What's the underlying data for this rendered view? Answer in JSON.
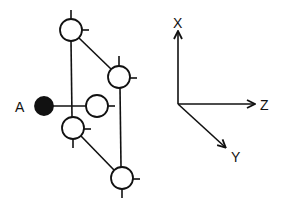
{
  "diagram": {
    "type": "molecular-geometry",
    "colors": {
      "stroke": "#111111",
      "fill_open": "#ffffff",
      "fill_solid": "#111111",
      "background": "#ffffff"
    },
    "atom_label": "A",
    "axes": {
      "x_label": "X",
      "y_label": "Y",
      "z_label": "Z"
    },
    "nodes": [
      {
        "id": "top",
        "cx": 71,
        "cy": 30,
        "r": 11,
        "filled": false
      },
      {
        "id": "right-upper",
        "cx": 119,
        "cy": 77,
        "r": 11,
        "filled": false
      },
      {
        "id": "middle",
        "cx": 97,
        "cy": 106,
        "r": 11,
        "filled": false
      },
      {
        "id": "left-lower",
        "cx": 73,
        "cy": 128,
        "r": 11,
        "filled": false
      },
      {
        "id": "bottom-right",
        "cx": 122,
        "cy": 178,
        "r": 11,
        "filled": false
      },
      {
        "id": "A",
        "cx": 44,
        "cy": 106,
        "r": 9,
        "filled": true
      }
    ]
  }
}
